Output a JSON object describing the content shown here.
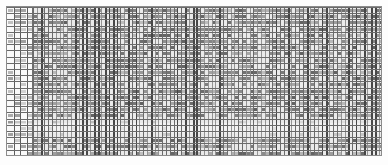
{
  "document": {
    "kind": "data-grid",
    "title": "Spreadsheet data grid",
    "description": "Dense tabular data grid rendered at reduced scale; cell text is not legible."
  },
  "canvas": {
    "width_px": 388,
    "height_px": 165,
    "background_color": "#ffffff",
    "margin_left_px": 6,
    "margin_top_px": 6
  },
  "grid": {
    "x_px": 6,
    "y_px": 6,
    "width_px": 376,
    "height_px": 150,
    "border_color": "#8c8c8c",
    "rule_color": "#5d5d5d",
    "row_rule_color": "#6a6a6a",
    "cell_fill_color": "#808080",
    "header_pane_background": "#fafafa",
    "data_pane_background": "#eaeaea",
    "row_count": 24,
    "row_pitch_px": 6.2,
    "header_column_count": 4,
    "header_pane_width_px": 26,
    "data_column_count": 92,
    "data_column_pitch_px": 3.8,
    "separator_band": {
      "top_px": 116,
      "height_px": 10,
      "color": "#f7f7f7",
      "label": "blank separator row"
    },
    "legible_text": "none",
    "color_mode": "grayscale"
  }
}
